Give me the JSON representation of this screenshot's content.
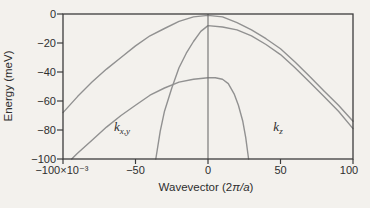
{
  "figure": {
    "background": "#f3f1ed",
    "frame_color": "#3c3c3c",
    "curve_color": "#919191",
    "divider_color": "#6e6e6e",
    "text_color": "#2e2e2e"
  },
  "chart_data": {
    "type": "line",
    "title": "",
    "xlabel": "Wavevector (2π/a)",
    "xlabel_parts": {
      "prefix": "Wavevector (2",
      "math": "π/a",
      "suffix": ")"
    },
    "ylabel": "Energy (meV)",
    "x_unit_multiplier": "×10⁻³",
    "xlim": [
      -100,
      100
    ],
    "ylim": [
      -100,
      0
    ],
    "grid": false,
    "legend": "none",
    "x_ticks": [
      {
        "value": -100,
        "label": "−100×10⁻³"
      },
      {
        "value": -50,
        "label": "−50"
      },
      {
        "value": 0,
        "label": "0"
      },
      {
        "value": 50,
        "label": "50"
      },
      {
        "value": 100,
        "label": "100"
      }
    ],
    "y_ticks": [
      {
        "value": 0,
        "label": "0"
      },
      {
        "value": -20,
        "label": "−20"
      },
      {
        "value": -40,
        "label": "−40"
      },
      {
        "value": -60,
        "label": "−60"
      },
      {
        "value": -80,
        "label": "−80"
      },
      {
        "value": -100,
        "label": "−100"
      }
    ],
    "zone_divider_x": 0,
    "annotations": [
      {
        "base": "k",
        "sub": "x,y",
        "x": -55,
        "y": -80
      },
      {
        "base": "k",
        "sub": "z",
        "x": 51,
        "y": -80
      }
    ],
    "series": [
      {
        "name": "band-1",
        "points": [
          [
            -100,
            -68
          ],
          [
            -90,
            -57
          ],
          [
            -80,
            -47
          ],
          [
            -70,
            -38
          ],
          [
            -60,
            -30
          ],
          [
            -50,
            -22
          ],
          [
            -40,
            -15
          ],
          [
            -30,
            -10
          ],
          [
            -20,
            -5
          ],
          [
            -10,
            -2
          ],
          [
            0,
            -1
          ],
          [
            10,
            -2
          ],
          [
            20,
            -6
          ],
          [
            30,
            -11
          ],
          [
            40,
            -17
          ],
          [
            50,
            -24
          ],
          [
            60,
            -33
          ],
          [
            70,
            -43
          ],
          [
            80,
            -53
          ],
          [
            90,
            -63
          ],
          [
            100,
            -74
          ]
        ]
      },
      {
        "name": "band-2",
        "points": [
          [
            -36,
            -100
          ],
          [
            -33,
            -81
          ],
          [
            -30,
            -67
          ],
          [
            -25,
            -51
          ],
          [
            -20,
            -37
          ],
          [
            -15,
            -27
          ],
          [
            -10,
            -19
          ],
          [
            -5,
            -12
          ],
          [
            0,
            -8
          ],
          [
            10,
            -9
          ],
          [
            20,
            -11
          ],
          [
            30,
            -15
          ],
          [
            40,
            -21
          ],
          [
            50,
            -28
          ],
          [
            60,
            -37
          ],
          [
            70,
            -47
          ],
          [
            80,
            -57
          ],
          [
            90,
            -67
          ],
          [
            100,
            -79
          ]
        ]
      },
      {
        "name": "band-3",
        "points": [
          [
            -94,
            -100
          ],
          [
            -90,
            -96
          ],
          [
            -80,
            -87
          ],
          [
            -70,
            -78
          ],
          [
            -60,
            -70
          ],
          [
            -50,
            -63
          ],
          [
            -40,
            -56
          ],
          [
            -30,
            -51
          ],
          [
            -20,
            -47
          ],
          [
            -10,
            -45
          ],
          [
            0,
            -44
          ],
          [
            5,
            -44
          ],
          [
            10,
            -45
          ],
          [
            14,
            -48
          ],
          [
            18,
            -55
          ],
          [
            21,
            -63
          ],
          [
            24,
            -74
          ],
          [
            26,
            -85
          ],
          [
            28,
            -100
          ]
        ]
      }
    ]
  }
}
